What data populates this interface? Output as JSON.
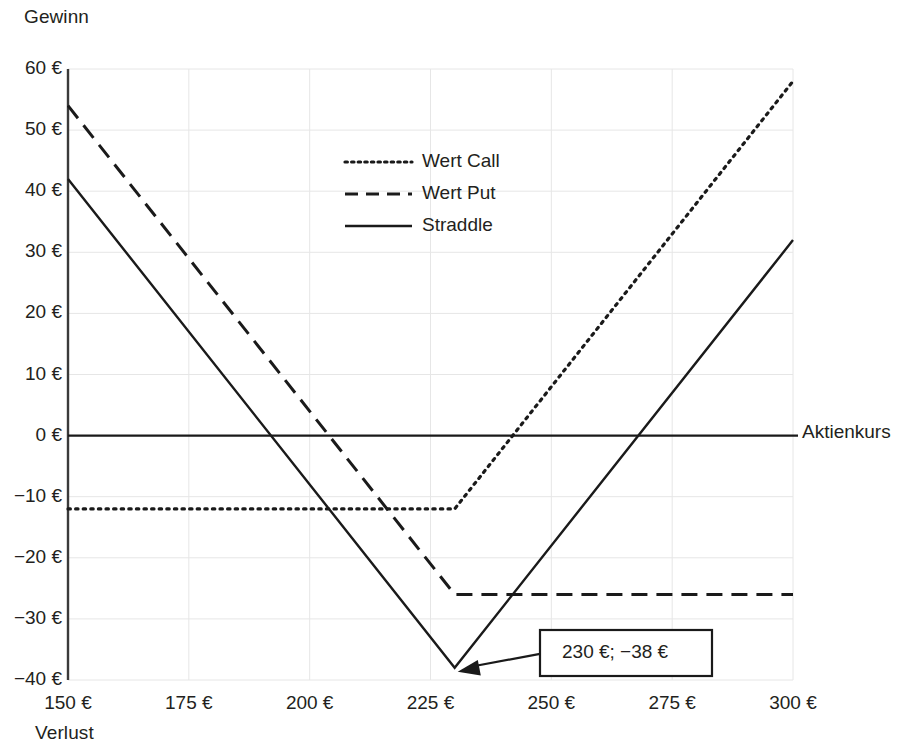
{
  "chart_data": {
    "type": "line",
    "title": "",
    "subtitle": "",
    "xlabel": "Aktienkurs",
    "ylabel": "Gewinn",
    "ylabel_secondary": "Verlust",
    "xlim": [
      150,
      300
    ],
    "ylim": [
      -40,
      60
    ],
    "grid": true,
    "legend_position": "upper-center-left",
    "x_tick_labels": [
      "150 €",
      "175 €",
      "200 €",
      "225 €",
      "250 €",
      "275 €",
      "300 €"
    ],
    "x_tick_values": [
      150,
      175,
      200,
      225,
      250,
      275,
      300
    ],
    "y_tick_labels": [
      "60 €",
      "50 €",
      "40 €",
      "30 €",
      "20 €",
      "10 €",
      "0 €",
      "−10 €",
      "−20 €",
      "−30 €",
      "−40 €"
    ],
    "y_tick_values": [
      60,
      50,
      40,
      30,
      20,
      10,
      0,
      -10,
      -20,
      -30,
      -40
    ],
    "strike": 230,
    "series": [
      {
        "name": "Wert Call",
        "style": "dotted",
        "color": "#1a1a1a",
        "x": [
          150,
          230,
          300
        ],
        "y": [
          -12,
          -12,
          58
        ]
      },
      {
        "name": "Wert Put",
        "style": "dashed",
        "color": "#1a1a1a",
        "x": [
          150,
          230,
          300
        ],
        "y": [
          54,
          -26,
          -26
        ]
      },
      {
        "name": "Straddle",
        "style": "solid",
        "color": "#1a1a1a",
        "x": [
          150,
          230,
          300
        ],
        "y": [
          42,
          -38,
          32
        ]
      }
    ],
    "zero_line": {
      "name": "Aktienkurs",
      "y": 0,
      "style": "solid"
    },
    "annotations": [
      {
        "label": "230 €; −38 €",
        "point_x": 230,
        "point_y": -38,
        "box": true,
        "arrow": true
      }
    ]
  },
  "legend": {
    "items": [
      {
        "label": "Wert Call",
        "style": "dotted"
      },
      {
        "label": "Wert Put",
        "style": "dashed"
      },
      {
        "label": "Straddle",
        "style": "solid"
      }
    ]
  },
  "labels": {
    "gewinn": "Gewinn",
    "verlust": "Verlust",
    "aktienkurs": "Aktienkurs"
  },
  "colors": {
    "line": "#1a1a1a",
    "grid": "#e6e6e6",
    "axis": "#3a3a3a",
    "text": "#231f20",
    "background": "#ffffff"
  }
}
